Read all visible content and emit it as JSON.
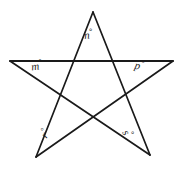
{
  "figure": {
    "name": "pentagram-star-angles",
    "background_color": "#ffffff",
    "stroke_color": "#1a1a1a",
    "stroke_width": 1.6
  },
  "chart_data": {
    "type": "diagram",
    "shape": "five-pointed-star",
    "title": "",
    "vertices": [
      {
        "id": "top",
        "label": "n",
        "x": 93,
        "y": 12
      },
      {
        "id": "right",
        "label": "p",
        "x": 173,
        "y": 61
      },
      {
        "id": "bottom-right",
        "label": "s",
        "x": 150,
        "y": 155
      },
      {
        "id": "bottom-left",
        "label": "r",
        "x": 36,
        "y": 157
      },
      {
        "id": "left",
        "label": "m",
        "x": 10,
        "y": 61
      }
    ],
    "edges": [
      [
        "top",
        "bottom-right"
      ],
      [
        "bottom-right",
        "left"
      ],
      [
        "left",
        "right"
      ],
      [
        "right",
        "bottom-left"
      ],
      [
        "bottom-left",
        "top"
      ]
    ]
  },
  "labels": {
    "top": {
      "variable": "n",
      "degree_symbol": "°"
    },
    "upper_left": {
      "variable": "m",
      "degree_symbol": "°"
    },
    "upper_right": {
      "variable": "p",
      "degree_symbol": "°"
    },
    "lower_left": {
      "variable": "r",
      "degree_symbol": "°"
    },
    "lower_right": {
      "variable": "s",
      "degree_symbol": "°"
    }
  }
}
